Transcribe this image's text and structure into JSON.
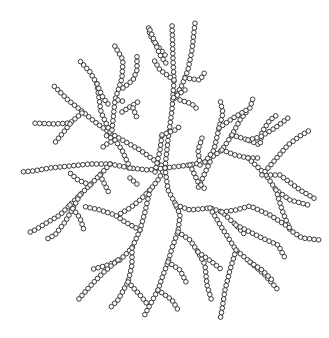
{
  "diagram": {
    "title": "",
    "bead_radius": 2.3,
    "bead_spacing": 4.6,
    "bead_fill": "#ffffff",
    "bead_stroke": "#3a3a3a",
    "bead_stroke_width": 1.0,
    "background": "#ffffff",
    "branches": [
      [
        [
          165,
          168
        ],
        [
          140,
          150
        ],
        [
          110,
          133
        ],
        [
          95,
          122
        ],
        [
          83,
          112
        ],
        [
          68,
          100
        ],
        [
          54,
          86
        ]
      ],
      [
        [
          82,
          113
        ],
        [
          70,
          123
        ],
        [
          55,
          124
        ],
        [
          31,
          123
        ]
      ],
      [
        [
          70,
          124
        ],
        [
          62,
          134
        ],
        [
          53,
          145
        ]
      ],
      [
        [
          110,
          132
        ],
        [
          101,
          112
        ],
        [
          97,
          84
        ],
        [
          90,
          72
        ],
        [
          80,
          61
        ]
      ],
      [
        [
          97,
          84
        ],
        [
          103,
          98
        ],
        [
          108,
          104
        ]
      ],
      [
        [
          112,
          130
        ],
        [
          115,
          100
        ],
        [
          122,
          78
        ],
        [
          123,
          60
        ],
        [
          113,
          43
        ]
      ],
      [
        [
          118,
          100
        ],
        [
          126,
          102
        ]
      ],
      [
        [
          123,
          88
        ],
        [
          133,
          80
        ],
        [
          137,
          70
        ],
        [
          137,
          53
        ]
      ],
      [
        [
          122,
          112
        ],
        [
          133,
          105
        ],
        [
          141,
          100
        ]
      ],
      [
        [
          133,
          108
        ],
        [
          137,
          118
        ]
      ],
      [
        [
          165,
          55
        ],
        [
          155,
          43
        ],
        [
          150,
          35
        ],
        [
          148,
          25
        ]
      ],
      [
        [
          165,
          168
        ],
        [
          168,
          140
        ],
        [
          172,
          110
        ],
        [
          174,
          80
        ],
        [
          173,
          60
        ],
        [
          172,
          23
        ]
      ],
      [
        [
          174,
          80
        ],
        [
          160,
          70
        ],
        [
          154,
          60
        ]
      ],
      [
        [
          175,
          98
        ],
        [
          182,
          85
        ],
        [
          188,
          70
        ],
        [
          192,
          50
        ],
        [
          195,
          23
        ]
      ],
      [
        [
          185,
          78
        ],
        [
          200,
          80
        ],
        [
          205,
          72
        ]
      ],
      [
        [
          180,
          100
        ],
        [
          192,
          104
        ],
        [
          198,
          110
        ]
      ],
      [
        [
          150,
          30
        ],
        [
          160,
          55
        ],
        [
          168,
          66
        ]
      ],
      [
        [
          185,
          90
        ],
        [
          170,
          100
        ]
      ],
      [
        [
          165,
          168
        ],
        [
          190,
          165
        ],
        [
          205,
          162
        ],
        [
          222,
          150
        ],
        [
          232,
          135
        ],
        [
          240,
          120
        ],
        [
          248,
          110
        ]
      ],
      [
        [
          205,
          162
        ],
        [
          214,
          150
        ],
        [
          219,
          128
        ],
        [
          223,
          113
        ],
        [
          220,
          100
        ]
      ],
      [
        [
          219,
          128
        ],
        [
          233,
          118
        ],
        [
          250,
          108
        ],
        [
          253,
          98
        ]
      ],
      [
        [
          232,
          135
        ],
        [
          248,
          140
        ],
        [
          260,
          145
        ],
        [
          262,
          132
        ],
        [
          270,
          120
        ],
        [
          277,
          115
        ]
      ],
      [
        [
          248,
          140
        ],
        [
          260,
          137
        ],
        [
          275,
          128
        ],
        [
          288,
          118
        ]
      ],
      [
        [
          222,
          150
        ],
        [
          235,
          155
        ],
        [
          248,
          158
        ],
        [
          262,
          158
        ]
      ],
      [
        [
          248,
          158
        ],
        [
          266,
          175
        ],
        [
          276,
          190
        ],
        [
          290,
          200
        ],
        [
          308,
          205
        ]
      ],
      [
        [
          266,
          175
        ],
        [
          280,
          175
        ],
        [
          300,
          190
        ],
        [
          317,
          200
        ]
      ],
      [
        [
          276,
          190
        ],
        [
          282,
          210
        ],
        [
          290,
          230
        ],
        [
          302,
          238
        ],
        [
          320,
          240
        ]
      ],
      [
        [
          262,
          175
        ],
        [
          275,
          160
        ],
        [
          288,
          145
        ],
        [
          300,
          136
        ],
        [
          310,
          130
        ]
      ],
      [
        [
          210,
          162
        ],
        [
          204,
          175
        ],
        [
          198,
          188
        ]
      ],
      [
        [
          190,
          165
        ],
        [
          198,
          182
        ],
        [
          206,
          190
        ]
      ],
      [
        [
          165,
          168
        ],
        [
          158,
          180
        ],
        [
          150,
          190
        ],
        [
          140,
          200
        ],
        [
          130,
          208
        ],
        [
          118,
          215
        ]
      ],
      [
        [
          150,
          190
        ],
        [
          145,
          212
        ],
        [
          140,
          230
        ],
        [
          132,
          248
        ],
        [
          120,
          260
        ],
        [
          108,
          265
        ],
        [
          90,
          270
        ]
      ],
      [
        [
          140,
          230
        ],
        [
          125,
          222
        ],
        [
          115,
          215
        ],
        [
          100,
          210
        ],
        [
          82,
          206
        ]
      ],
      [
        [
          132,
          248
        ],
        [
          132,
          265
        ],
        [
          128,
          282
        ],
        [
          118,
          300
        ],
        [
          110,
          308
        ]
      ],
      [
        [
          128,
          282
        ],
        [
          140,
          295
        ],
        [
          148,
          305
        ]
      ],
      [
        [
          118,
          260
        ],
        [
          104,
          272
        ],
        [
          94,
          282
        ],
        [
          85,
          292
        ],
        [
          78,
          300
        ]
      ],
      [
        [
          165,
          168
        ],
        [
          168,
          190
        ],
        [
          176,
          205
        ],
        [
          180,
          215
        ],
        [
          178,
          232
        ],
        [
          172,
          248
        ],
        [
          168,
          262
        ],
        [
          162,
          278
        ],
        [
          158,
          290
        ],
        [
          150,
          305
        ],
        [
          143,
          318
        ]
      ],
      [
        [
          176,
          205
        ],
        [
          190,
          210
        ],
        [
          210,
          208
        ],
        [
          222,
          212
        ],
        [
          236,
          225
        ],
        [
          246,
          236
        ]
      ],
      [
        [
          236,
          225
        ],
        [
          250,
          232
        ],
        [
          262,
          238
        ],
        [
          278,
          245
        ],
        [
          285,
          258
        ]
      ],
      [
        [
          222,
          212
        ],
        [
          236,
          210
        ],
        [
          250,
          206
        ],
        [
          270,
          215
        ],
        [
          290,
          228
        ]
      ],
      [
        [
          210,
          208
        ],
        [
          222,
          228
        ],
        [
          236,
          250
        ],
        [
          250,
          262
        ],
        [
          265,
          275
        ],
        [
          278,
          290
        ]
      ],
      [
        [
          236,
          250
        ],
        [
          230,
          270
        ],
        [
          225,
          290
        ],
        [
          222,
          310
        ],
        [
          220,
          320
        ]
      ],
      [
        [
          250,
          262
        ],
        [
          262,
          270
        ],
        [
          272,
          280
        ]
      ],
      [
        [
          178,
          232
        ],
        [
          190,
          240
        ],
        [
          198,
          252
        ],
        [
          205,
          265
        ],
        [
          207,
          285
        ],
        [
          212,
          302
        ]
      ],
      [
        [
          198,
          252
        ],
        [
          212,
          262
        ],
        [
          222,
          270
        ]
      ],
      [
        [
          168,
          262
        ],
        [
          180,
          270
        ],
        [
          186,
          282
        ]
      ],
      [
        [
          158,
          290
        ],
        [
          172,
          300
        ],
        [
          178,
          310
        ]
      ],
      [
        [
          165,
          168
        ],
        [
          148,
          170
        ],
        [
          130,
          168
        ],
        [
          110,
          164
        ],
        [
          90,
          164
        ],
        [
          70,
          166
        ],
        [
          50,
          168
        ],
        [
          33,
          171
        ],
        [
          20,
          172
        ]
      ],
      [
        [
          110,
          164
        ],
        [
          100,
          175
        ],
        [
          90,
          185
        ],
        [
          80,
          195
        ],
        [
          70,
          205
        ],
        [
          60,
          215
        ],
        [
          48,
          222
        ],
        [
          35,
          230
        ],
        [
          28,
          233
        ]
      ],
      [
        [
          90,
          185
        ],
        [
          78,
          180
        ],
        [
          70,
          173
        ]
      ],
      [
        [
          80,
          195
        ],
        [
          72,
          210
        ],
        [
          65,
          222
        ],
        [
          55,
          235
        ],
        [
          45,
          240
        ]
      ],
      [
        [
          100,
          175
        ],
        [
          105,
          185
        ],
        [
          110,
          195
        ]
      ],
      [
        [
          70,
          205
        ],
        [
          80,
          218
        ],
        [
          84,
          230
        ]
      ],
      [
        [
          130,
          168
        ],
        [
          122,
          150
        ],
        [
          115,
          140
        ],
        [
          105,
          135
        ]
      ],
      [
        [
          115,
          140
        ],
        [
          105,
          145
        ],
        [
          100,
          150
        ]
      ],
      [
        [
          130,
          178
        ],
        [
          138,
          185
        ]
      ],
      [
        [
          155,
          172
        ],
        [
          160,
          150
        ],
        [
          162,
          135
        ]
      ],
      [
        [
          162,
          135
        ],
        [
          175,
          130
        ],
        [
          182,
          125
        ]
      ],
      [
        [
          200,
          165
        ],
        [
          198,
          150
        ],
        [
          202,
          138
        ]
      ]
    ]
  }
}
